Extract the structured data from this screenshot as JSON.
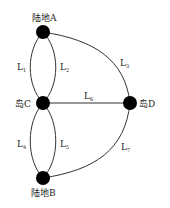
{
  "diagram": {
    "nodes": [
      {
        "id": "A",
        "label": "陆地A",
        "x": 43,
        "y": 32
      },
      {
        "id": "C",
        "label": "岛C",
        "x": 43,
        "y": 103
      },
      {
        "id": "D",
        "label": "岛D",
        "x": 130,
        "y": 103
      },
      {
        "id": "B",
        "label": "陆地B",
        "x": 43,
        "y": 178
      }
    ],
    "edges": [
      {
        "id": "L1",
        "base": "L",
        "sub": "1",
        "from": "A",
        "to": "C"
      },
      {
        "id": "L2",
        "base": "L",
        "sub": "2",
        "from": "A",
        "to": "C"
      },
      {
        "id": "L3",
        "base": "L",
        "sub": "3",
        "from": "A",
        "to": "D"
      },
      {
        "id": "L4",
        "base": "L",
        "sub": "4",
        "from": "C",
        "to": "B"
      },
      {
        "id": "L5",
        "base": "L",
        "sub": "5",
        "from": "C",
        "to": "B"
      },
      {
        "id": "L6",
        "base": "L",
        "sub": "6",
        "from": "C",
        "to": "D"
      },
      {
        "id": "L7",
        "base": "L",
        "sub": "7",
        "from": "B",
        "to": "D"
      }
    ],
    "node_color": "#000000",
    "edge_color": "#333333"
  }
}
